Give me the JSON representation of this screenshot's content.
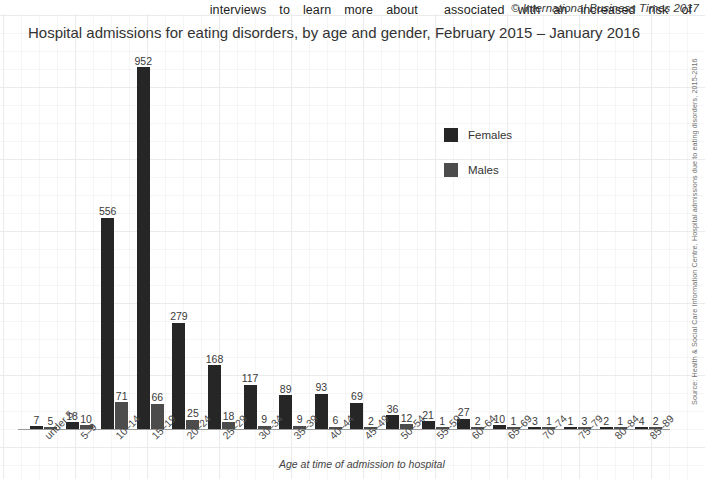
{
  "ocr_strip": {
    "fragments": [
      "interviews",
      "to",
      "learn",
      "more",
      "about",
      "associated",
      "with",
      "an",
      "increased",
      "risk",
      "of"
    ]
  },
  "credit": "© International Business Times 2017",
  "chart_data": {
    "type": "bar",
    "title": "Hospital admissions for eating disorders, by age and gender, February 2015 – January 2016",
    "xlabel": "Age at time of admission to hospital",
    "ylabel": "",
    "ylim": [
      0,
      952
    ],
    "grid": true,
    "legend_position": "center-right",
    "source": "Source: Health & Social Care Information Centre, Hospital admissions due to eating disorders, 2015-2016",
    "categories": [
      "under 5",
      "5–9",
      "10–14",
      "15–19",
      "20–24",
      "25–29",
      "30–34",
      "35–39",
      "40–44",
      "45–49",
      "50–54",
      "55–59",
      "60–64",
      "65–69",
      "70–74",
      "75–79",
      "80–84",
      "85–89"
    ],
    "series": [
      {
        "name": "Females",
        "color": "#262626",
        "values": [
          7,
          18,
          556,
          952,
          279,
          168,
          117,
          89,
          93,
          69,
          36,
          21,
          27,
          10,
          3,
          1,
          2,
          4
        ]
      },
      {
        "name": "Males",
        "color": "#4c4c4c",
        "values": [
          5,
          10,
          71,
          66,
          25,
          18,
          9,
          9,
          6,
          2,
          12,
          1,
          2,
          1,
          1,
          3,
          1,
          2
        ]
      }
    ]
  }
}
